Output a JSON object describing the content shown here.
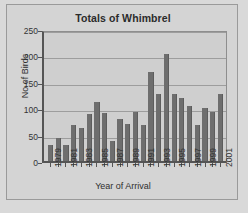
{
  "chart_data": {
    "type": "bar",
    "title": "Totals of Whimbrel",
    "xlabel": "Year of Arrival",
    "ylabel": "No of Birds",
    "ylim": [
      0,
      250
    ],
    "ytick_step": 50,
    "yticks": [
      0,
      50,
      100,
      150,
      200,
      250
    ],
    "grid": true,
    "legend": "none",
    "bar_color": "#6e6e6e",
    "categories": [
      "1979",
      "1980",
      "1981",
      "1982",
      "1983",
      "1984",
      "1985",
      "1986",
      "1987",
      "1988",
      "1989",
      "1990",
      "1991",
      "1992",
      "1993",
      "1994",
      "1995",
      "1996",
      "1997",
      "1998",
      "1999",
      "2000",
      "2001"
    ],
    "xtick_labels": [
      "1979",
      "1981",
      "1983",
      "1985",
      "1987",
      "1989",
      "1991",
      "1993",
      "1995",
      "1997",
      "1999",
      "2001"
    ],
    "values": [
      30,
      44,
      30,
      68,
      62,
      89,
      112,
      91,
      38,
      80,
      70,
      93,
      68,
      169,
      126,
      203,
      127,
      119,
      105,
      68,
      101,
      92,
      126
    ]
  },
  "figure": {
    "background_color": "#d4d4d4",
    "plot_background_color": "#cfcfcf",
    "border_color": "#9a9a9a"
  }
}
